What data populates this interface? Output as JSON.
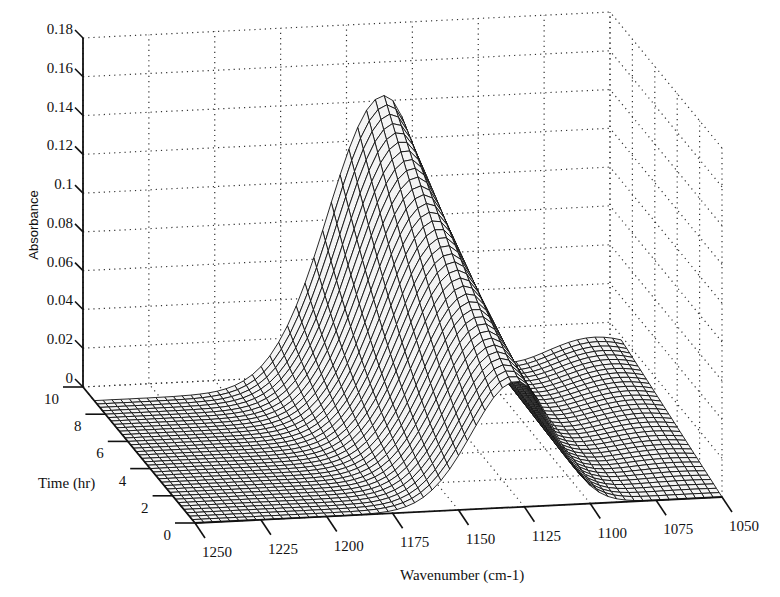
{
  "chart_data": {
    "type": "surface3d",
    "title": "",
    "xlabel": "Wavenumber (cm-1)",
    "ylabel": "Time (hr)",
    "zlabel": "Absorbance",
    "x_ticks": [
      "1250",
      "1225",
      "1200",
      "1175",
      "1150",
      "1125",
      "1100",
      "1075",
      "1050"
    ],
    "y_ticks": [
      "0",
      "2",
      "4",
      "6",
      "8",
      "10"
    ],
    "z_ticks": [
      "0",
      "0.02",
      "0.04",
      "0.06",
      "0.08",
      "0.1",
      "0.12",
      "0.14",
      "0.16",
      "0.18"
    ],
    "xlim": [
      1250,
      1050
    ],
    "ylim": [
      0,
      10
    ],
    "zlim": [
      0,
      0.18
    ],
    "grid": true,
    "render_style": "wireframe mesh",
    "series": [
      {
        "name": "t=0 hr",
        "peak_wavenumber": 1128,
        "peak_absorbance": 0.065
      },
      {
        "name": "t=2 hr",
        "peak_wavenumber": 1130,
        "peak_absorbance": 0.075
      },
      {
        "name": "t=4 hr",
        "peak_wavenumber": 1133,
        "peak_absorbance": 0.09
      },
      {
        "name": "t=6 hr",
        "peak_wavenumber": 1136,
        "peak_absorbance": 0.11
      },
      {
        "name": "t=8 hr",
        "peak_wavenumber": 1139,
        "peak_absorbance": 0.135
      },
      {
        "name": "t=9 hr",
        "peak_wavenumber": 1140,
        "peak_absorbance": 0.15
      }
    ],
    "time_range_of_surface": [
      0,
      9
    ],
    "baseline_absorbance_at_1250": 0.0
  },
  "axes": {
    "z_title": "Absorbance",
    "y_title": "Time (hr)",
    "x_title": "Wavenumber (cm-1)"
  }
}
